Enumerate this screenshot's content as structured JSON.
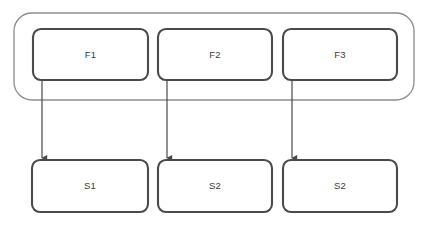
{
  "diagram": {
    "type": "flow-diagram",
    "canvas": {
      "width": 428,
      "height": 228,
      "background": "#ffffff"
    },
    "colors": {
      "node_stroke": "#4a4a4a",
      "node_fill": "#ffffff",
      "group_stroke": "#8d8d8d",
      "arrow_stroke": "#4a4a4a",
      "label_text": "#3a3a3a"
    },
    "group": {
      "name": "outer-group",
      "label": "",
      "x": 14,
      "y": 13,
      "width": 400,
      "height": 87,
      "radius": 18,
      "stroke_width": 1.3
    },
    "top_row": {
      "y": 29,
      "height": 51,
      "nodes": [
        {
          "id": "F1",
          "label": "F1",
          "x": 33,
          "width": 115
        },
        {
          "id": "F2",
          "label": "F2",
          "x": 158,
          "width": 114
        },
        {
          "id": "F3",
          "label": "F3",
          "x": 283,
          "width": 114
        }
      ]
    },
    "bottom_row": {
      "y": 160,
      "height": 52,
      "nodes": [
        {
          "id": "S1",
          "label": "S1",
          "x": 32,
          "width": 116
        },
        {
          "id": "S2a",
          "label": "S2",
          "x": 158,
          "width": 114
        },
        {
          "id": "S2b",
          "label": "S2",
          "x": 283,
          "width": 114
        }
      ]
    },
    "edges": [
      {
        "id": "edge-f1-s1",
        "from": "F1",
        "to": "S1",
        "x": 42,
        "y_start": 80,
        "y_end": 158
      },
      {
        "id": "edge-f2-s2a",
        "from": "F2",
        "to": "S2a",
        "x": 167,
        "y_start": 80,
        "y_end": 158
      },
      {
        "id": "edge-f3-s2b",
        "from": "F3",
        "to": "S2b",
        "x": 292,
        "y_start": 80,
        "y_end": 158
      }
    ]
  }
}
